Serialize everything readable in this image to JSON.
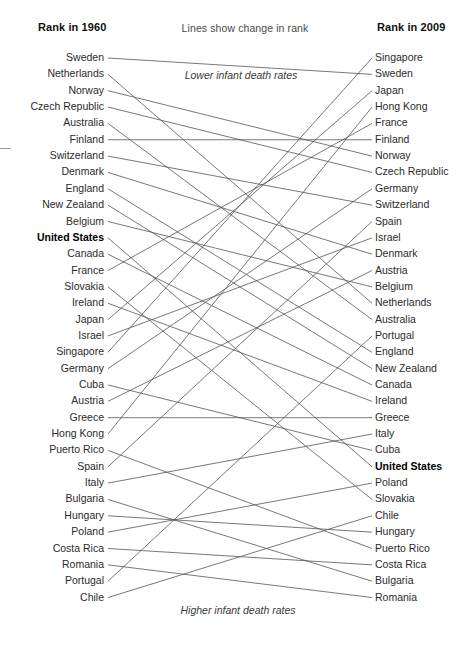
{
  "header": {
    "left_title": "Rank in 1960",
    "right_title": "Rank in 2009",
    "middle_note": "Lines show change in rank"
  },
  "annotations": {
    "top": "Lower infant death rates",
    "bottom": "Higher infant death rates"
  },
  "style": {
    "line_color": "#555555",
    "text_color": "#2b2b2b",
    "highlight_color": "#000000",
    "background": "#ffffff",
    "highlight_entity": "United States"
  },
  "chart_data": {
    "type": "line",
    "chart_subtype": "slopegraph",
    "title": "Lines show change in rank",
    "xlabel": "",
    "ylabel": "Rank",
    "axis_labels": [
      "Rank in 1960",
      "Rank in 2009"
    ],
    "x": [
      1960,
      2009
    ],
    "ylim": [
      1,
      30
    ],
    "y_inverted": true,
    "grid": false,
    "legend": "none",
    "annotations": [
      "Lower infant death rates",
      "Higher infant death rates"
    ],
    "highlight": [
      "United States"
    ],
    "categories_1960": [
      "Sweden",
      "Netherlands",
      "Norway",
      "Czech Republic",
      "Australia",
      "Finland",
      "Switzerland",
      "Denmark",
      "England",
      "New Zealand",
      "Belgium",
      "United States",
      "Canada",
      "France",
      "Slovakia",
      "Ireland",
      "Japan",
      "Israel",
      "Singapore",
      "Germany",
      "Cuba",
      "Austria",
      "Greece",
      "Hong Kong",
      "Puerto Rico",
      "Spain",
      "Italy",
      "Bulgaria",
      "Hungary",
      "Poland",
      "Costa Rica",
      "Romania",
      "Portugal",
      "Chile"
    ],
    "categories_2009": [
      "Singapore",
      "Sweden",
      "Japan",
      "Hong Kong",
      "France",
      "Finland",
      "Norway",
      "Czech Republic",
      "Germany",
      "Switzerland",
      "Spain",
      "Israel",
      "Denmark",
      "Austria",
      "Belgium",
      "Netherlands",
      "Australia",
      "Portugal",
      "England",
      "New Zealand",
      "Canada",
      "Ireland",
      "Greece",
      "Italy",
      "Cuba",
      "United States",
      "Poland",
      "Slovakia",
      "Chile",
      "Hungary",
      "Puerto Rico",
      "Costa Rica",
      "Bulgaria",
      "Romania"
    ],
    "series": [
      {
        "name": "Sweden",
        "rank_1960": 1,
        "rank_2009": 2
      },
      {
        "name": "Netherlands",
        "rank_1960": 2,
        "rank_2009": 16
      },
      {
        "name": "Norway",
        "rank_1960": 3,
        "rank_2009": 7
      },
      {
        "name": "Czech Republic",
        "rank_1960": 4,
        "rank_2009": 8
      },
      {
        "name": "Australia",
        "rank_1960": 5,
        "rank_2009": 17
      },
      {
        "name": "Finland",
        "rank_1960": 6,
        "rank_2009": 6
      },
      {
        "name": "Switzerland",
        "rank_1960": 7,
        "rank_2009": 10
      },
      {
        "name": "Denmark",
        "rank_1960": 8,
        "rank_2009": 13
      },
      {
        "name": "England",
        "rank_1960": 9,
        "rank_2009": 19
      },
      {
        "name": "New Zealand",
        "rank_1960": 10,
        "rank_2009": 20
      },
      {
        "name": "Belgium",
        "rank_1960": 11,
        "rank_2009": 15
      },
      {
        "name": "United States",
        "rank_1960": 12,
        "rank_2009": 26
      },
      {
        "name": "Canada",
        "rank_1960": 13,
        "rank_2009": 21
      },
      {
        "name": "France",
        "rank_1960": 14,
        "rank_2009": 5
      },
      {
        "name": "Slovakia",
        "rank_1960": 15,
        "rank_2009": 28
      },
      {
        "name": "Ireland",
        "rank_1960": 16,
        "rank_2009": 22
      },
      {
        "name": "Japan",
        "rank_1960": 17,
        "rank_2009": 3
      },
      {
        "name": "Israel",
        "rank_1960": 18,
        "rank_2009": 12
      },
      {
        "name": "Singapore",
        "rank_1960": 19,
        "rank_2009": 1
      },
      {
        "name": "Germany",
        "rank_1960": 20,
        "rank_2009": 9
      },
      {
        "name": "Cuba",
        "rank_1960": 21,
        "rank_2009": 25
      },
      {
        "name": "Austria",
        "rank_1960": 22,
        "rank_2009": 14
      },
      {
        "name": "Greece",
        "rank_1960": 23,
        "rank_2009": 23
      },
      {
        "name": "Hong Kong",
        "rank_1960": 24,
        "rank_2009": 4
      },
      {
        "name": "Puerto Rico",
        "rank_1960": 25,
        "rank_2009": 31
      },
      {
        "name": "Spain",
        "rank_1960": 26,
        "rank_2009": 11
      },
      {
        "name": "Italy",
        "rank_1960": 27,
        "rank_2009": 24
      },
      {
        "name": "Bulgaria",
        "rank_1960": 28,
        "rank_2009": 33
      },
      {
        "name": "Hungary",
        "rank_1960": 29,
        "rank_2009": 30
      },
      {
        "name": "Poland",
        "rank_1960": 30,
        "rank_2009": 27
      },
      {
        "name": "Costa Rica",
        "rank_1960": 31,
        "rank_2009": 32
      },
      {
        "name": "Romania",
        "rank_1960": 32,
        "rank_2009": 34
      },
      {
        "name": "Portugal",
        "rank_1960": 33,
        "rank_2009": 18
      },
      {
        "name": "Chile",
        "rank_1960": 34,
        "rank_2009": 29
      }
    ]
  },
  "layout": {
    "first_row_y": 58,
    "row_spacing": 16.35,
    "left_line_x": 108,
    "right_line_x": 372
  }
}
